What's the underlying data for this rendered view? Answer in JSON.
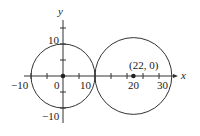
{
  "figure": {
    "axes": {
      "x_label": "x",
      "y_label": "y",
      "x_ticks_labeled": [
        {
          "value": -10,
          "label": "−10"
        },
        {
          "value": 0,
          "label": "0"
        },
        {
          "value": 10,
          "label": "10"
        },
        {
          "value": 20,
          "label": "20"
        },
        {
          "value": 30,
          "label": "30"
        }
      ],
      "y_ticks_labeled": [
        {
          "value": 10,
          "label": "10"
        },
        {
          "value": -10,
          "label": "−10"
        }
      ],
      "tick_spacing": 5
    },
    "circles": [
      {
        "center": [
          0,
          0
        ],
        "radius": 10
      },
      {
        "center": [
          22,
          0
        ],
        "radius": 12
      }
    ],
    "points": [
      {
        "x": 0,
        "y": 0,
        "label": ""
      },
      {
        "x": 22,
        "y": 0,
        "label": "(22, 0)"
      }
    ],
    "colors": {
      "stroke": "#333333",
      "text": "#222222"
    }
  }
}
